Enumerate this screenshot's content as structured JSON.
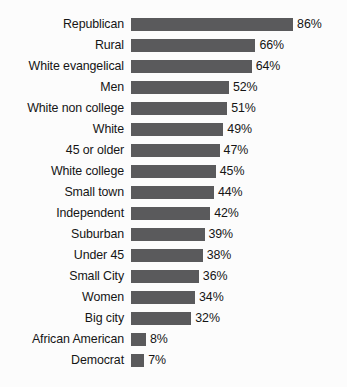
{
  "chart_data": {
    "type": "bar",
    "orientation": "horizontal",
    "title": "",
    "subtitle": "",
    "xlabel": "",
    "ylabel": "",
    "xlim": [
      0,
      100
    ],
    "grid": false,
    "legend": null,
    "value_suffix": "%",
    "bar_color": "#5a5a5c",
    "background_color": "#fcfcfc",
    "text_color": "#151515",
    "categories": [
      "Republican",
      "Rural",
      "White evangelical",
      "Men",
      "White non college",
      "White",
      "45 or older",
      "White college",
      "Small town",
      "Independent",
      "Suburban",
      "Under 45",
      "Small City",
      "Women",
      "Big city",
      "African American",
      "Democrat"
    ],
    "values": [
      86,
      66,
      64,
      52,
      51,
      49,
      47,
      45,
      44,
      42,
      39,
      38,
      36,
      34,
      32,
      8,
      7
    ],
    "value_labels": [
      "86%",
      "66%",
      "64%",
      "52%",
      "51%",
      "49%",
      "47%",
      "45%",
      "44%",
      "42%",
      "39%",
      "38%",
      "36%",
      "34%",
      "32%",
      "8%",
      "7%"
    ],
    "rows": [
      {
        "label": "Republican",
        "value": 86,
        "value_label": "86%"
      },
      {
        "label": "Rural",
        "value": 66,
        "value_label": "66%"
      },
      {
        "label": "White evangelical",
        "value": 64,
        "value_label": "64%"
      },
      {
        "label": "Men",
        "value": 52,
        "value_label": "52%"
      },
      {
        "label": "White non college",
        "value": 51,
        "value_label": "51%"
      },
      {
        "label": "White",
        "value": 49,
        "value_label": "49%"
      },
      {
        "label": "45 or older",
        "value": 47,
        "value_label": "47%"
      },
      {
        "label": "White college",
        "value": 45,
        "value_label": "45%"
      },
      {
        "label": "Small town",
        "value": 44,
        "value_label": "44%"
      },
      {
        "label": "Independent",
        "value": 42,
        "value_label": "42%"
      },
      {
        "label": "Suburban",
        "value": 39,
        "value_label": "39%"
      },
      {
        "label": "Under 45",
        "value": 38,
        "value_label": "38%"
      },
      {
        "label": "Small City",
        "value": 36,
        "value_label": "36%"
      },
      {
        "label": "Women",
        "value": 34,
        "value_label": "34%"
      },
      {
        "label": "Big city",
        "value": 32,
        "value_label": "32%"
      },
      {
        "label": "African American",
        "value": 8,
        "value_label": "8%"
      },
      {
        "label": "Democrat",
        "value": 7,
        "value_label": "7%"
      }
    ]
  }
}
